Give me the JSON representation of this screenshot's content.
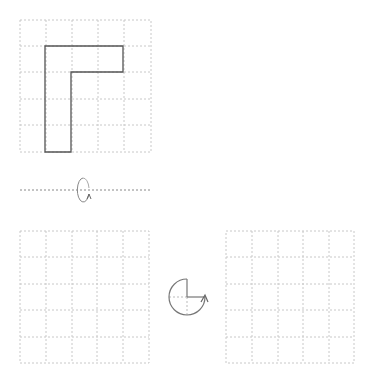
{
  "diagram": {
    "colors": {
      "grid": "#c8c8c8",
      "shape": "#555555",
      "icon": "#777777",
      "axis": "#888888"
    },
    "grids": [
      {
        "id": "source-grid",
        "x": 20,
        "y": 20,
        "size": 131,
        "cells": 5
      },
      {
        "id": "answer-grid-1",
        "x": 20,
        "y": 231,
        "size": 131,
        "cells": 5
      },
      {
        "id": "answer-grid-2",
        "x": 226,
        "y": 231,
        "size": 131,
        "cells": 5
      }
    ],
    "shape": {
      "name": "L-shape",
      "points": "45,46 123,46 123,72 71,72 71,152 45,152"
    },
    "flip_axis": {
      "y": 190,
      "x1": 20,
      "x2": 150
    },
    "flip_icon": {
      "cx": 83,
      "cy": 190,
      "rx": 6,
      "ry": 12
    },
    "rotate_icon": {
      "cx": 187,
      "cy": 297,
      "r": 18,
      "angle": "270"
    }
  }
}
